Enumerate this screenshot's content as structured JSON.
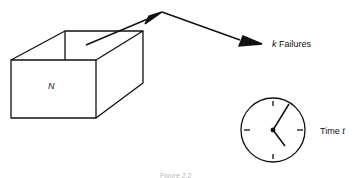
{
  "box": {
    "label": "N"
  },
  "failures": {
    "variable": "k",
    "text": "Failures"
  },
  "time": {
    "text": "Time",
    "variable": "t"
  },
  "caption": {
    "text": "Figure 2.2"
  }
}
